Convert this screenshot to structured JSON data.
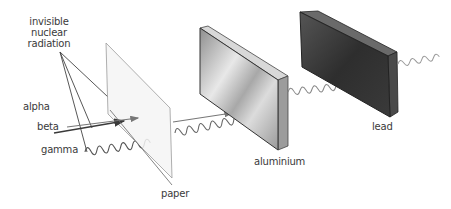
{
  "diagram": {
    "title_label": [
      "invisible",
      "nuclear",
      "radiation"
    ],
    "radiation_types": [
      {
        "name": "alpha",
        "stopped_by": "paper"
      },
      {
        "name": "beta",
        "stopped_by": "aluminium"
      },
      {
        "name": "gamma",
        "stopped_by": "lead"
      }
    ],
    "barriers": [
      {
        "name": "paper",
        "color": "#f4f4f4"
      },
      {
        "name": "aluminium",
        "color": "#b5b5b5"
      },
      {
        "name": "lead",
        "color": "#3e3e3e"
      }
    ],
    "labels": {
      "radiation_line1": "invisible",
      "radiation_line2": "nuclear",
      "radiation_line3": "radiation",
      "alpha": "alpha",
      "beta": "beta",
      "gamma": "gamma",
      "paper": "paper",
      "aluminium": "aluminium",
      "lead": "lead"
    },
    "colors": {
      "text": "#3a3a3a",
      "line": "#555555",
      "beam": "#666666"
    }
  }
}
